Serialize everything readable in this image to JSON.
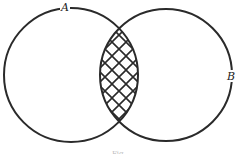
{
  "diagram": {
    "type": "venn",
    "circles": [
      {
        "id": "A",
        "label": "A",
        "cx": 71,
        "cy": 75,
        "r": 67
      },
      {
        "id": "B",
        "label": "B",
        "cx": 166,
        "cy": 75,
        "r": 66
      }
    ],
    "intersection": {
      "fill": "crosshatch",
      "description": "A ∩ B shaded"
    },
    "caption": "Fig."
  },
  "colors": {
    "line": "#2a2a2a",
    "background": "#ffffff"
  }
}
